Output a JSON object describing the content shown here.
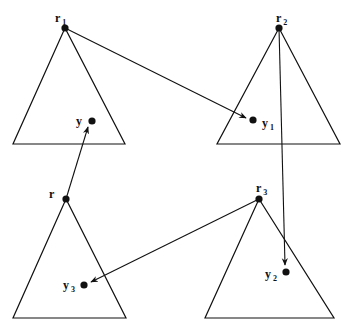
{
  "diagram": {
    "stroke_color": "#111111",
    "background": "#ffffff",
    "triangles": [
      {
        "id": "T1",
        "apex": [
          65,
          28
        ],
        "left": [
          13,
          144
        ],
        "right": [
          125,
          144
        ]
      },
      {
        "id": "T2",
        "apex": [
          279,
          28
        ],
        "left": [
          217,
          144
        ],
        "right": [
          340,
          144
        ]
      },
      {
        "id": "T3",
        "apex": [
          66,
          199
        ],
        "left": [
          13,
          318
        ],
        "right": [
          126,
          318
        ]
      },
      {
        "id": "T4",
        "apex": [
          259,
          199
        ],
        "left": [
          205,
          318
        ],
        "right": [
          334,
          318
        ]
      }
    ],
    "nodes": [
      {
        "id": "r1",
        "label": "r",
        "sub": "1",
        "pos": [
          65,
          28
        ],
        "label_pos": [
          55,
          22
        ]
      },
      {
        "id": "r2",
        "label": "r",
        "sub": "2",
        "pos": [
          279,
          28
        ],
        "label_pos": [
          276,
          22
        ]
      },
      {
        "id": "r",
        "label": "r",
        "sub": "",
        "pos": [
          66,
          199
        ],
        "label_pos": [
          49,
          198
        ]
      },
      {
        "id": "r3",
        "label": "r",
        "sub": "3",
        "pos": [
          259,
          199
        ],
        "label_pos": [
          256,
          192
        ]
      },
      {
        "id": "y",
        "label": "y",
        "sub": "",
        "pos": [
          92,
          121
        ],
        "label_pos": [
          76,
          125
        ]
      },
      {
        "id": "y1",
        "label": "y",
        "sub": "1",
        "pos": [
          253,
          120
        ],
        "label_pos": [
          262,
          127
        ]
      },
      {
        "id": "y3",
        "label": "y",
        "sub": "3",
        "pos": [
          84,
          285
        ],
        "label_pos": [
          63,
          289
        ]
      },
      {
        "id": "y2",
        "label": "y",
        "sub": "2",
        "pos": [
          286,
          272
        ],
        "label_pos": [
          265,
          278
        ]
      }
    ],
    "arrows": [
      {
        "from": "r1",
        "x1": 65,
        "y1": 28,
        "x2": 246,
        "y2": 118
      },
      {
        "from": "r",
        "x1": 66,
        "y1": 199,
        "x2": 88,
        "y2": 127
      },
      {
        "from": "r2",
        "x1": 279,
        "y1": 28,
        "x2": 285,
        "y2": 265
      },
      {
        "from": "r3",
        "x1": 259,
        "y1": 199,
        "x2": 91,
        "y2": 282
      }
    ]
  }
}
